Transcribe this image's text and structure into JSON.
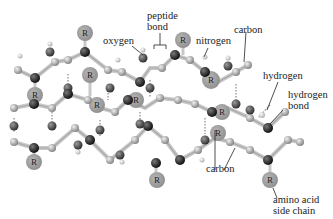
{
  "diagram": {
    "labels": {
      "oxygen": "oxygen",
      "peptide_bond_line1": "peptide",
      "peptide_bond_line2": "bond",
      "nitrogen": "nitrogen",
      "carbon_top": "carbon",
      "hydrogen": "hydrogen",
      "hydrogen_bond_line1": "hydrogen",
      "hydrogen_bond_line2": "bond",
      "carbon_bottom": "carbon",
      "side_chain_line1": "amino acid",
      "side_chain_line2": "side chain"
    },
    "side_chain_symbol": "R",
    "colors": {
      "carbon": "#a8a8a8",
      "nitrogen": "#1a1a1a",
      "oxygen": "#3a3a3a",
      "side_chain": "#9a9a9a",
      "bond": "#d0d0d0"
    }
  }
}
